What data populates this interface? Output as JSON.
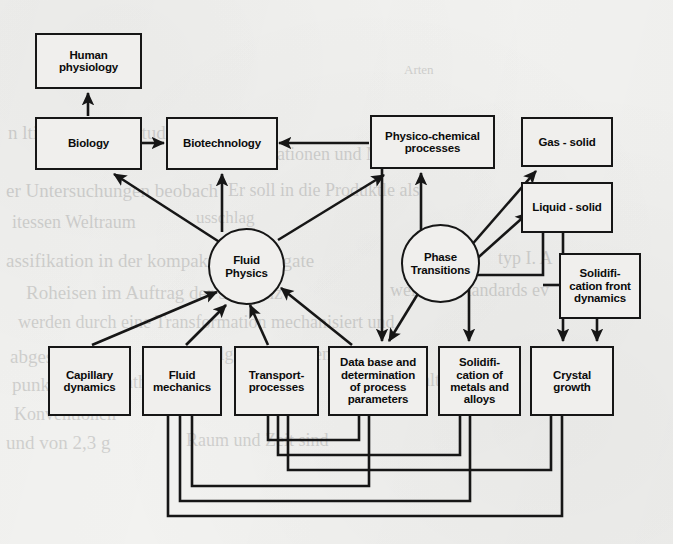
{
  "diagram": {
    "background_color": "#f2f2f0",
    "line_color": "#161616",
    "box_fill": "#f0efed"
  },
  "nodes": {
    "human_physiology": "Human\nphysiology",
    "biology": "Biology",
    "biotechnology": "Biotechnology",
    "physico_chemical": "Physico-chemical\nprocesses",
    "gas_solid": "Gas - solid",
    "liquid_solid": "Liquid - solid",
    "solidification_front": "Solidifi-\ncation front\ndynamics",
    "fluid_physics": "Fluid\nPhysics",
    "phase_transitions": "Phase\nTransitions",
    "capillary_dynamics": "Capillary\ndynamics",
    "fluid_mechanics": "Fluid\nmechanics",
    "transport_processes": "Transport-\nprocesses",
    "data_base": "Data base and\ndetermination\nof process\nparameters",
    "solidification_metals": "Solidifi-\ncation of\nmetals and\nalloys",
    "crystal_growth": "Crystal\ngrowth"
  },
  "edges": [
    {
      "from": "biology",
      "to": "human_physiology",
      "style": "arrow"
    },
    {
      "from": "biology",
      "to": "biotechnology",
      "style": "arrow"
    },
    {
      "from": "physico_chemical",
      "to": "biotechnology",
      "style": "arrow"
    },
    {
      "from": "fluid_physics",
      "to": "biology",
      "style": "arrow"
    },
    {
      "from": "fluid_physics",
      "to": "biotechnology",
      "style": "arrow"
    },
    {
      "from": "fluid_physics",
      "to": "physico_chemical",
      "style": "arrow"
    },
    {
      "from": "fluid_physics",
      "to": "data_base",
      "style": "arrow"
    },
    {
      "from": "phase_transitions",
      "to": "physico_chemical",
      "style": "arrow"
    },
    {
      "from": "phase_transitions",
      "to": "gas_solid",
      "style": "arrow"
    },
    {
      "from": "phase_transitions",
      "to": "liquid_solid",
      "style": "arrow"
    },
    {
      "from": "phase_transitions",
      "to": "data_base",
      "style": "arrow"
    },
    {
      "from": "physico_chemical",
      "to": "data_base",
      "style": "arrow"
    },
    {
      "from": "capillary_dynamics",
      "to": "fluid_physics",
      "style": "arrow"
    },
    {
      "from": "fluid_mechanics",
      "to": "fluid_physics",
      "style": "arrow"
    },
    {
      "from": "transport_processes",
      "to": "fluid_physics",
      "style": "arrow"
    },
    {
      "from": "data_base",
      "to": "fluid_physics",
      "style": "arrow"
    },
    {
      "from": "liquid_solid",
      "to": "solidification_metals",
      "style": "arrow"
    },
    {
      "from": "liquid_solid",
      "to": "crystal_growth",
      "style": "arrow"
    },
    {
      "from": "solidification_front",
      "to": "crystal_growth",
      "style": "arrow"
    },
    {
      "from": "fluid_mechanics",
      "to": "data_base",
      "style": "feedback"
    },
    {
      "from": "fluid_mechanics",
      "to": "solidification_metals",
      "style": "feedback"
    },
    {
      "from": "fluid_mechanics",
      "to": "crystal_growth",
      "style": "feedback"
    },
    {
      "from": "transport_processes",
      "to": "data_base",
      "style": "feedback"
    },
    {
      "from": "transport_processes",
      "to": "solidification_metals",
      "style": "feedback"
    },
    {
      "from": "transport_processes",
      "to": "crystal_growth",
      "style": "feedback"
    }
  ],
  "ghost_text": [
    {
      "t": "Arten",
      "x": 404,
      "y": 62,
      "s": 13
    },
    {
      "t": "n lti-Phasen-Fallstudien",
      "x": 8,
      "y": 122,
      "s": 19
    },
    {
      "t": "Zeitung",
      "x": 170,
      "y": 146,
      "s": 17
    },
    {
      "t": "Raumstationen und Mikrogra",
      "x": 222,
      "y": 144,
      "s": 18
    },
    {
      "t": "er Untersuchungen beobach",
      "x": 6,
      "y": 180,
      "s": 19
    },
    {
      "t": "Er soll in die Produktle als",
      "x": 228,
      "y": 180,
      "s": 18
    },
    {
      "t": "itessen Weltraum",
      "x": 12,
      "y": 212,
      "s": 18
    },
    {
      "t": "usschlag",
      "x": 196,
      "y": 208,
      "s": 17
    },
    {
      "t": "assifikation in der kompakten Aggregate",
      "x": 6,
      "y": 250,
      "s": 19
    },
    {
      "t": "typ I. A",
      "x": 498,
      "y": 248,
      "s": 18
    },
    {
      "t": "Roheisen im Auftrag der Sequenz",
      "x": 26,
      "y": 282,
      "s": 19
    },
    {
      "t": "weiteren Standards ev",
      "x": 390,
      "y": 280,
      "s": 18
    },
    {
      "t": "werden durch eine Transformation mechanisiert und",
      "x": 18,
      "y": 312,
      "s": 18
    },
    {
      "t": "abgestimmt",
      "x": 10,
      "y": 346,
      "s": 19
    },
    {
      "t": "Die Folgen ab mit den dar",
      "x": 170,
      "y": 344,
      "s": 18
    },
    {
      "t": "punkts",
      "x": 12,
      "y": 374,
      "s": 19
    },
    {
      "t": "enthaltenden",
      "x": 116,
      "y": 372,
      "s": 18
    },
    {
      "t": "Erhaltung",
      "x": 396,
      "y": 370,
      "s": 18
    },
    {
      "t": "Konventionen",
      "x": 14,
      "y": 404,
      "s": 18
    },
    {
      "t": "und von 2,3 g",
      "x": 6,
      "y": 432,
      "s": 19
    },
    {
      "t": "Raum und Zeit sind",
      "x": 186,
      "y": 430,
      "s": 18
    }
  ]
}
